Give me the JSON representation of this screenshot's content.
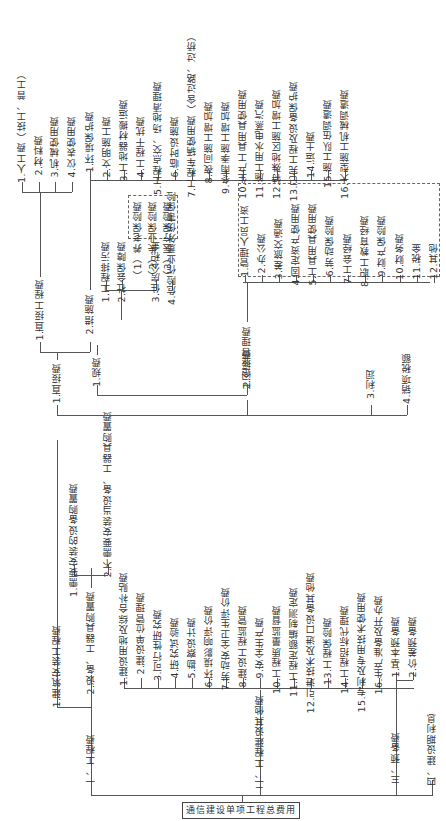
{
  "root": "通信建设单项工程总费用",
  "level1": [
    {
      "label": "一、工程费"
    },
    {
      "label": "二、工程建设其他费"
    },
    {
      "label": "三、预备费"
    },
    {
      "label": "四、建设期利息"
    }
  ],
  "engineering": {
    "items": [
      {
        "label": "1.建筑安装工程费"
      },
      {
        "label": "2.设备、工器具购置费"
      }
    ],
    "equipment": [
      {
        "label": "1.需要安装的设备购置费"
      },
      {
        "label": "2.不需要安装当设备、工器具购置费"
      }
    ]
  },
  "construction": {
    "items": [
      {
        "label": "1.直接费"
      },
      {
        "label": "2.间接费"
      },
      {
        "label": "3.利润"
      },
      {
        "label": "4.销项税额"
      }
    ],
    "direct": [
      {
        "label": "1.直接工程费"
      },
      {
        "label": "2.措施费"
      }
    ],
    "direct_engineering": [
      {
        "label": "1.人工费（技工、普工）"
      },
      {
        "label": "2.材料费"
      },
      {
        "label": "3.机械使用费"
      },
      {
        "label": "4.仪表使用费"
      }
    ],
    "measures": [
      {
        "label": "1.环境保护费"
      },
      {
        "label": "2.文明施工费"
      },
      {
        "label": "3.工地器材搬运费"
      },
      {
        "label": "4.工程干扰费"
      },
      {
        "label": "5.工程点交、场地清理费"
      },
      {
        "label": "6.临时设施费"
      },
      {
        "label": "7.工程车辆使用费（含过路、过桥）"
      },
      {
        "label": "8.夜间施工增加费"
      },
      {
        "label": "9.冬雨季施工增加费"
      },
      {
        "label": "10.生产工具用具使用费"
      },
      {
        "label": "11.施工用水电蒸汽费"
      },
      {
        "label": "12.特殊地区施工增加费"
      },
      {
        "label": "13.已完工程及设备保护费"
      },
      {
        "label": "14.运土费"
      },
      {
        "label": "15.施工队伍调遣费"
      },
      {
        "label": "16.大型施工机械调遣费"
      }
    ],
    "indirect": [
      {
        "label": "1.规费"
      },
      {
        "label": "2.企业管理费"
      }
    ],
    "fees": [
      {
        "label": "1.工程排污费"
      },
      {
        "label": "2.社会保障费"
      },
      {
        "label": "3.住房公积金"
      },
      {
        "label": "4.危险作业意外伤害保险"
      }
    ],
    "social_security": [
      {
        "label": "（1）养老保险费"
      },
      {
        "label": "（2）失业保险费"
      },
      {
        "label": "（3）医疗保险费"
      }
    ],
    "management": [
      {
        "label": "1.管理人员工资"
      },
      {
        "label": "2.办公费"
      },
      {
        "label": "3.差旅交通费"
      },
      {
        "label": "4.固定资产使用费"
      },
      {
        "label": "5.工具用具使用费"
      },
      {
        "label": "6.劳动保险费"
      },
      {
        "label": "7.工会经费"
      },
      {
        "label": "8.职工教育经费"
      },
      {
        "label": "9.财产保险费"
      },
      {
        "label": "10.财务费"
      },
      {
        "label": "11.税金"
      },
      {
        "label": "12.其他"
      }
    ]
  },
  "other_costs": [
    {
      "label": "1.建设用地及综合补贴费"
    },
    {
      "label": "2.建设单位管理费"
    },
    {
      "label": "3.可行性研究费"
    },
    {
      "label": "4.研究试验费"
    },
    {
      "label": "5.勘察设计费"
    },
    {
      "label": "6.环境影响评价费"
    },
    {
      "label": "7.劳动安全卫生评价费"
    },
    {
      "label": "8.建设工程监管费"
    },
    {
      "label": "9.安全生产费"
    },
    {
      "label": "10.工程质量监督费"
    },
    {
      "label": "11.工程定额编制测定费"
    },
    {
      "label": "12.引进技术及进口设备其他费"
    },
    {
      "label": "13.工程保险费"
    },
    {
      "label": "14.工程招标代理费"
    },
    {
      "label": "15.专利及专用技术使用费"
    },
    {
      "label": "16.生产准备及开办费"
    }
  ],
  "reserve": [
    {
      "label": "1.基本预备费"
    },
    {
      "label": "2.价差预备费"
    }
  ]
}
